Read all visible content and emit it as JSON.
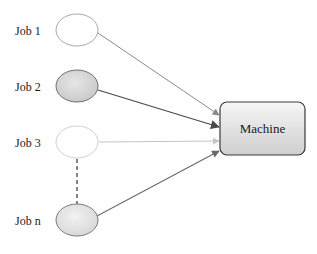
{
  "diagram": {
    "type": "job-to-machine assignment",
    "jobs": [
      {
        "label": "Job 1",
        "cx": 77,
        "cy": 30,
        "fill": "#ffffff",
        "stroke": "#a8a8a8",
        "arrow_color": "#8a8a8a",
        "arrow_end_y": 115
      },
      {
        "label": "Job 2",
        "cx": 77,
        "cy": 86,
        "fill": "#d9d9d9",
        "stroke": "#6e6e6e",
        "arrow_color": "#4a4a4a",
        "arrow_end_y": 127
      },
      {
        "label": "Job 3",
        "cx": 77,
        "cy": 142,
        "fill": "#ffffff",
        "stroke": "#d0d0d0",
        "arrow_color": "#c4c4c4",
        "arrow_end_y": 141
      },
      {
        "label": "Job n",
        "cx": 77,
        "cy": 220,
        "fill": "#e6e6e6",
        "stroke": "#7a7a7a",
        "arrow_color": "#6a6a6a",
        "arrow_end_y": 151
      }
    ],
    "machine": {
      "label": "Machine",
      "x": 220,
      "y": 102,
      "width": 85,
      "height": 53,
      "fill_top": "#f4f4f4",
      "fill_bottom": "#d2d2d2",
      "stroke": "#3a3a3a"
    },
    "ellipsis_connector": {
      "style": "dashed",
      "from": "Job 3",
      "to": "Job n",
      "color": "#333333"
    }
  }
}
